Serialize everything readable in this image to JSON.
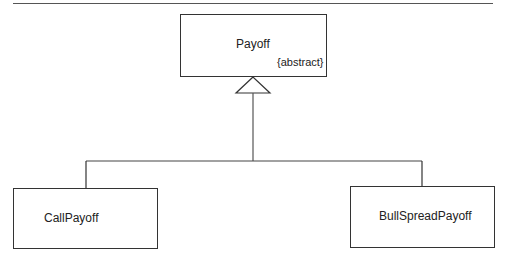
{
  "diagram": {
    "type": "UML class inheritance diagram",
    "parent": {
      "name": "Payoff",
      "constraint": "{abstract}"
    },
    "children": [
      {
        "name": "CallPayoff"
      },
      {
        "name": "BullSpreadPayoff"
      }
    ],
    "relationship": "generalization (hollow triangle arrow pointing to parent)",
    "colors": {
      "line": "#333333",
      "background": "#ffffff",
      "text": "#222222"
    }
  }
}
